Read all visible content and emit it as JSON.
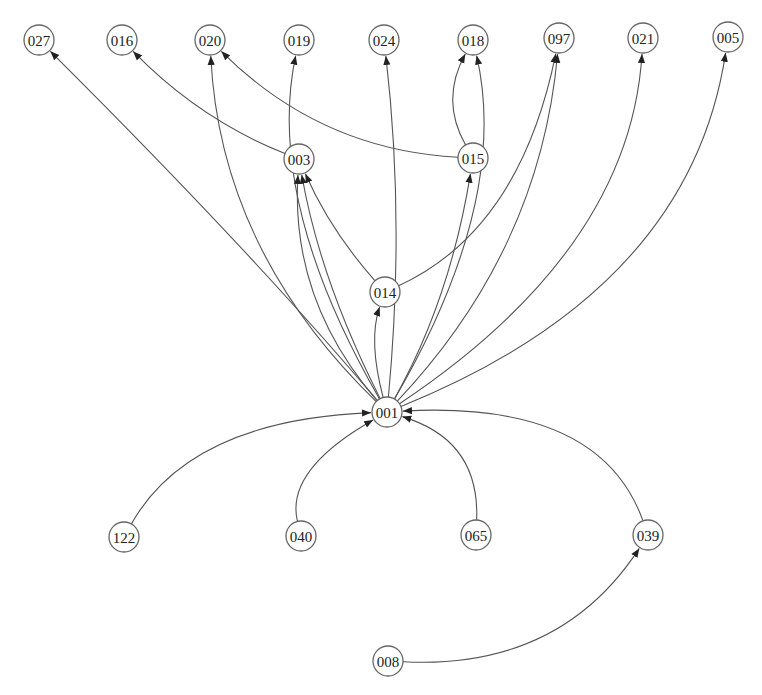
{
  "diagram": {
    "type": "directed-graph",
    "colors": {
      "edge": "#555555",
      "node_stroke": "#666666",
      "node_fill": "#ffffff",
      "text": "#222222"
    },
    "nodes": [
      {
        "id": "027",
        "x": 39,
        "y": 40
      },
      {
        "id": "016",
        "x": 122,
        "y": 40
      },
      {
        "id": "020",
        "x": 210,
        "y": 40
      },
      {
        "id": "019",
        "x": 299,
        "y": 40
      },
      {
        "id": "024",
        "x": 384,
        "y": 40
      },
      {
        "id": "018",
        "x": 473,
        "y": 40
      },
      {
        "id": "097",
        "x": 559,
        "y": 38
      },
      {
        "id": "021",
        "x": 643,
        "y": 38
      },
      {
        "id": "005",
        "x": 728,
        "y": 37
      },
      {
        "id": "003",
        "x": 299,
        "y": 159
      },
      {
        "id": "015",
        "x": 473,
        "y": 158
      },
      {
        "id": "014",
        "x": 385,
        "y": 292
      },
      {
        "id": "001",
        "x": 387,
        "y": 412
      },
      {
        "id": "122",
        "x": 124,
        "y": 537
      },
      {
        "id": "040",
        "x": 301,
        "y": 536
      },
      {
        "id": "065",
        "x": 476,
        "y": 535
      },
      {
        "id": "039",
        "x": 648,
        "y": 535
      },
      {
        "id": "008",
        "x": 388,
        "y": 661
      }
    ],
    "edges": [
      {
        "from": "001",
        "to": "027",
        "c": [
          250,
          250
        ]
      },
      {
        "from": "001",
        "to": "020",
        "c": [
          220,
          250
        ]
      },
      {
        "from": "001",
        "to": "019",
        "c": [
          265,
          200
        ]
      },
      {
        "from": "001",
        "to": "003",
        "c": [
          290,
          300
        ]
      },
      {
        "from": "001",
        "to": "003",
        "c": [
          320,
          280
        ]
      },
      {
        "from": "001",
        "to": "014",
        "c": [
          368,
          340
        ]
      },
      {
        "from": "001",
        "to": "024",
        "c": [
          405,
          220
        ]
      },
      {
        "from": "001",
        "to": "015",
        "c": [
          450,
          300
        ]
      },
      {
        "from": "001",
        "to": "018",
        "c": [
          510,
          200
        ]
      },
      {
        "from": "001",
        "to": "097",
        "c": [
          540,
          250
        ]
      },
      {
        "from": "001",
        "to": "021",
        "c": [
          630,
          250
        ]
      },
      {
        "from": "001",
        "to": "005",
        "c": [
          690,
          290
        ]
      },
      {
        "from": "003",
        "to": "016",
        "c": [
          200,
          120
        ]
      },
      {
        "from": "015",
        "to": "020",
        "c": [
          320,
          150
        ]
      },
      {
        "from": "015",
        "to": "018",
        "c": [
          440,
          100
        ]
      },
      {
        "from": "014",
        "to": "097",
        "c": [
          520,
          230
        ]
      },
      {
        "from": "014",
        "to": "003",
        "c": [
          330,
          230
        ]
      },
      {
        "from": "122",
        "to": "001",
        "c": [
          190,
          420
        ]
      },
      {
        "from": "040",
        "to": "001",
        "c": [
          285,
          470
        ]
      },
      {
        "from": "065",
        "to": "001",
        "c": [
          480,
          440
        ]
      },
      {
        "from": "039",
        "to": "001",
        "c": [
          600,
          400
        ]
      },
      {
        "from": "008",
        "to": "039",
        "c": [
          560,
          670
        ]
      }
    ]
  }
}
